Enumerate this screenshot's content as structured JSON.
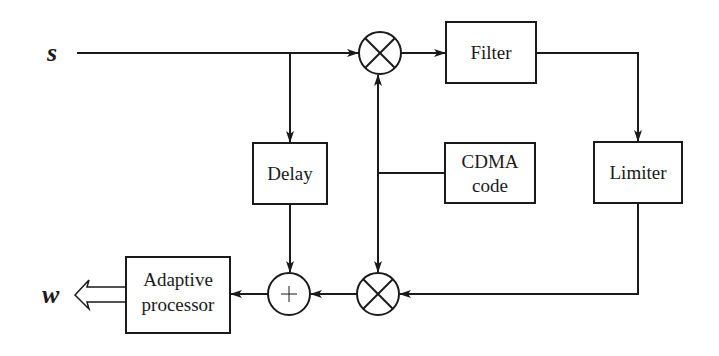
{
  "diagram": {
    "type": "block-diagram",
    "colors": {
      "stroke": "#1a1a1a",
      "background": "#ffffff"
    },
    "signals": {
      "input": "s",
      "output": "w"
    },
    "blocks": {
      "filter": {
        "label": "Filter"
      },
      "limiter": {
        "label": "Limiter"
      },
      "delay": {
        "label": "Delay"
      },
      "cdma": {
        "line1": "CDMA",
        "line2": "code"
      },
      "adaptive": {
        "line1": "Adaptive",
        "line2": "processor"
      }
    },
    "operators": {
      "top_multiplier": {
        "symbol": "multiply",
        "glyph": "⊗"
      },
      "bottom_multiplier": {
        "symbol": "multiply",
        "glyph": "⊗"
      },
      "summer": {
        "symbol": "add",
        "glyph": "+"
      }
    },
    "connections": [
      {
        "from": "s",
        "to": "top_multiplier"
      },
      {
        "from": "s",
        "to": "delay"
      },
      {
        "from": "top_multiplier",
        "to": "filter"
      },
      {
        "from": "filter",
        "to": "limiter"
      },
      {
        "from": "limiter",
        "to": "bottom_multiplier"
      },
      {
        "from": "cdma",
        "to": "top_multiplier"
      },
      {
        "from": "cdma",
        "to": "bottom_multiplier"
      },
      {
        "from": "bottom_multiplier",
        "to": "summer"
      },
      {
        "from": "delay",
        "to": "summer"
      },
      {
        "from": "summer",
        "to": "adaptive"
      },
      {
        "from": "adaptive",
        "to": "w"
      }
    ]
  }
}
